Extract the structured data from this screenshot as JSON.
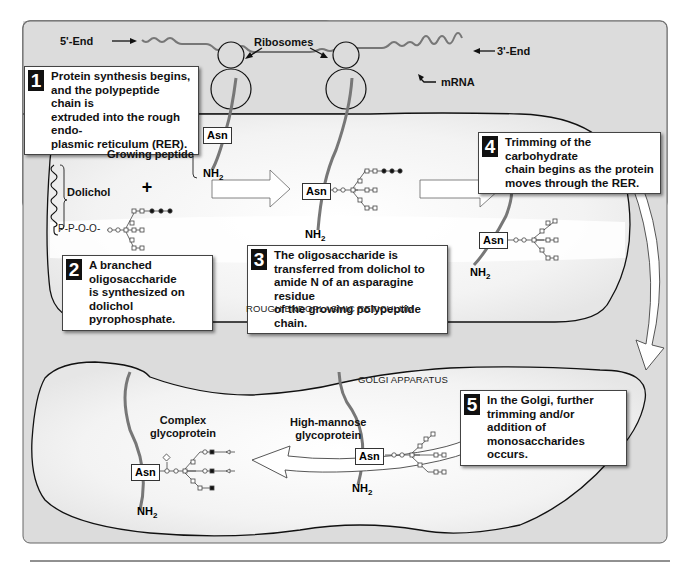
{
  "figure": {
    "colors": {
      "panel_bg": "#dcdcdc",
      "panel_border": "#555555",
      "lumen_fill": "#f4f4f4",
      "peptide": "#7a7a7a",
      "mrna": "#808080",
      "callout_number_bg": "#111111"
    },
    "mrna": {
      "five_end": "5'-End",
      "three_end": "3'-End",
      "ribosomes_label": "Ribosomes",
      "mrna_label": "mRNA"
    },
    "steps": [
      {
        "number": "1",
        "text": "Protein synthesis begins,\nand the polypeptide chain is\nextruded into the rough endo-\nplasmic reticulum (RER)."
      },
      {
        "number": "2",
        "text": "A branched oligosaccharide\nis synthesized on\ndolichol pyrophosphate."
      },
      {
        "number": "3",
        "text": "The oligosaccharide is\ntransferred from dolichol to\namide N of an asparagine residue\nof the growing polypeptide chain."
      },
      {
        "number": "4",
        "text": "Trimming of the carbohydrate\nchain begins as the protein\nmoves through the RER."
      },
      {
        "number": "5",
        "text": "In the Golgi, further\ntrimming and/or addition of\nmonosaccharides occurs."
      }
    ],
    "labels": {
      "growing_peptide": "Growing peptide",
      "dolichol": "Dolichol",
      "plus": "+",
      "dolichol_chain": "P-P-O-O-",
      "rer": "ROUGH ENDOPLASMIC RETICULUM",
      "golgi": "GOLGI APPARATUS",
      "complex": "Complex\nglycoprotein",
      "high_mannose": "High-mannose\nglycoprotein",
      "asn": "Asn",
      "nh2": "NH",
      "nh2_sub": "2"
    },
    "legend_symbols": {
      "open_circle": "GlcNAc",
      "open_square": "Mannose",
      "filled_circle": "Glucose",
      "filled_square": "Galactose",
      "open_triangle": "Sialic acid",
      "open_diamond": "Fucose"
    }
  }
}
